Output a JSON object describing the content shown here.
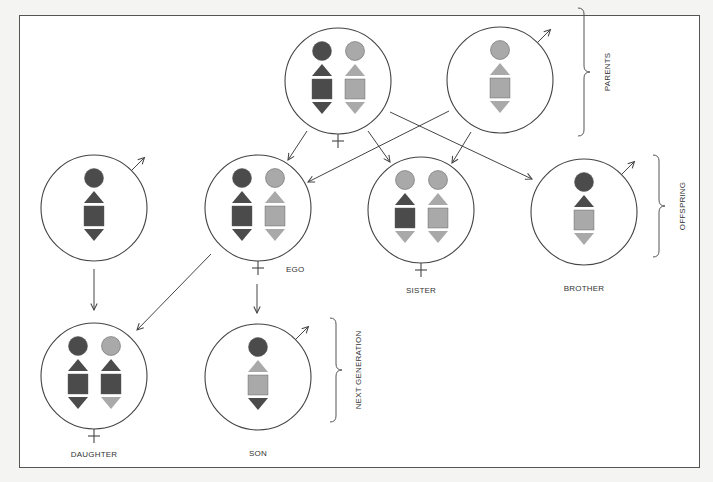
{
  "colors": {
    "background": "#f4f4f2",
    "frame": "#555555",
    "line": "#444444",
    "dark": "#4b4b4b",
    "light": "#a9a9a9"
  },
  "labels": {
    "ego": "EGO",
    "sister": "SISTER",
    "brother": "BROTHER",
    "daughter": "DAUGHTER",
    "son": "SON",
    "parents": "PARENTS",
    "offspring": "OFFSPRING",
    "next_generation": "NEXT GENERATION"
  },
  "individuals": [
    {
      "id": "mother",
      "sex": "female",
      "cx": 338,
      "cy": 81,
      "chromosomes": [
        [
          "dark",
          "dark",
          "dark",
          "dark"
        ],
        [
          "light",
          "light",
          "light",
          "light"
        ]
      ]
    },
    {
      "id": "father",
      "sex": "male",
      "cx": 500,
      "cy": 80,
      "chromosomes": [
        [
          "light",
          "light",
          "light",
          "light"
        ]
      ]
    },
    {
      "id": "mate",
      "sex": "male",
      "cx": 94,
      "cy": 208,
      "chromosomes": [
        [
          "dark",
          "dark",
          "dark",
          "dark"
        ]
      ]
    },
    {
      "id": "ego",
      "sex": "female",
      "cx": 258,
      "cy": 208,
      "chromosomes": [
        [
          "dark",
          "dark",
          "dark",
          "dark"
        ],
        [
          "light",
          "light",
          "light",
          "light"
        ]
      ]
    },
    {
      "id": "sister",
      "sex": "female",
      "cx": 421,
      "cy": 210,
      "chromosomes": [
        [
          "light",
          "dark",
          "dark",
          "light"
        ],
        [
          "light",
          "light",
          "light",
          "light"
        ]
      ]
    },
    {
      "id": "brother",
      "sex": "male",
      "cx": 584,
      "cy": 212,
      "chromosomes": [
        [
          "dark",
          "dark",
          "light",
          "light"
        ]
      ]
    },
    {
      "id": "daughter",
      "sex": "female",
      "cx": 94,
      "cy": 376,
      "chromosomes": [
        [
          "dark",
          "dark",
          "dark",
          "dark"
        ],
        [
          "light",
          "dark",
          "dark",
          "light"
        ]
      ]
    },
    {
      "id": "son",
      "sex": "male",
      "cx": 258,
      "cy": 377,
      "chromosomes": [
        [
          "dark",
          "light",
          "light",
          "dark"
        ]
      ]
    }
  ],
  "arrows": [
    {
      "from": "mother",
      "to": "ego",
      "x1": 307,
      "y1": 131,
      "x2": 288,
      "y2": 160
    },
    {
      "from": "mother",
      "to": "sister",
      "x1": 368,
      "y1": 131,
      "x2": 390,
      "y2": 162
    },
    {
      "from": "mother",
      "to": "brother",
      "x1": 390,
      "y1": 112,
      "x2": 532,
      "y2": 179
    },
    {
      "from": "father",
      "to": "ego",
      "x1": 449,
      "y1": 111,
      "x2": 308,
      "y2": 182
    },
    {
      "from": "father",
      "to": "sister",
      "x1": 471,
      "y1": 132,
      "x2": 452,
      "y2": 163
    },
    {
      "from": "mate",
      "to": "daughter",
      "x1": 94,
      "y1": 269,
      "x2": 94,
      "y2": 310
    },
    {
      "from": "ego",
      "to": "daughter",
      "x1": 211,
      "y1": 254,
      "x2": 137,
      "y2": 330
    },
    {
      "from": "ego",
      "to": "son",
      "x1": 257,
      "y1": 284,
      "x2": 257,
      "y2": 313
    }
  ]
}
